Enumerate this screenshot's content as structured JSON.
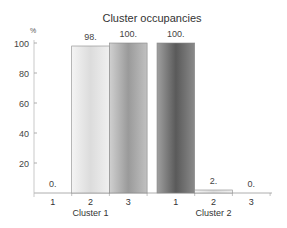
{
  "chart_data": {
    "type": "bar",
    "title": "Cluster occupancies",
    "ylabel": "%",
    "xlabel": "",
    "ylim": [
      0,
      100
    ],
    "yticks": [
      20,
      40,
      60,
      80,
      100
    ],
    "grid": false,
    "legend": "none",
    "groups": [
      {
        "name": "Cluster 1",
        "categories": [
          "1",
          "2",
          "3"
        ],
        "values": [
          0,
          98,
          100
        ],
        "labels": [
          "0.",
          "98.",
          "100."
        ],
        "colors": [
          "#ffffff",
          "#e8e8e8",
          "#a8a8a8"
        ]
      },
      {
        "name": "Cluster 2",
        "categories": [
          "1",
          "2",
          "3"
        ],
        "values": [
          100,
          2,
          0
        ],
        "labels": [
          "100.",
          "2.",
          "0."
        ],
        "colors": [
          "#707070",
          "#e8e8e8",
          "#ffffff"
        ]
      }
    ]
  }
}
